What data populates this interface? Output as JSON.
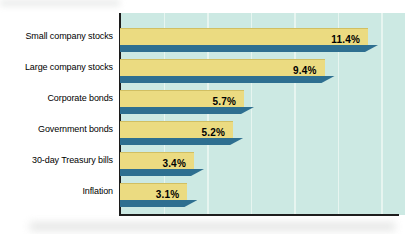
{
  "chart_data": {
    "type": "bar",
    "orientation": "horizontal",
    "title": "",
    "xlabel": "",
    "ylabel": "",
    "categories": [
      "Small company stocks",
      "Large company stocks",
      "Corporate bonds",
      "Government bonds",
      "30-day Treasury bills",
      "Inflation"
    ],
    "values": [
      11.4,
      9.4,
      5.7,
      5.2,
      3.4,
      3.1
    ],
    "value_labels": [
      "11.4%",
      "9.4%",
      "5.7%",
      "5.2%",
      "3.4%",
      "3.1%"
    ],
    "xlim": [
      0,
      13.1
    ],
    "gridlines_at_percent": [
      2,
      4,
      6,
      8,
      10,
      12
    ],
    "grid": "vertical light lines, drawn behind bars",
    "legend": "none",
    "value_label_position": "inside bar, right-aligned, bold",
    "bar_style": "flat yellow bar with dark teal drop-shadow ribbon below, slanted right end",
    "colors": {
      "bar_fill": "#ebdb81",
      "bar_shadow": "#2e6f90",
      "plot_background": "#cce9e3",
      "gridline": "#e7f5f0",
      "axis": "#1c1c1c",
      "label_text": "#000000",
      "value_text": "#000000",
      "page_background": "#ffffff"
    }
  }
}
